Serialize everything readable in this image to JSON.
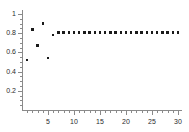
{
  "chart_data": {
    "type": "scatter",
    "title": "",
    "subtitle": "",
    "xlabel": "",
    "ylabel": "",
    "xlim": [
      0,
      30
    ],
    "ylim": [
      0,
      1
    ],
    "grid": false,
    "legend": null,
    "marker": "square",
    "marker_color": "#1a1a1a",
    "axis_color": "#8a8a8a",
    "x_ticks": [
      5,
      10,
      15,
      20,
      25,
      30
    ],
    "x_tick_labels": [
      "5",
      "10",
      "15",
      "20",
      "25",
      "30"
    ],
    "y_ticks": [
      0.2,
      0.4,
      0.6,
      0.8,
      1
    ],
    "y_tick_labels": [
      "0.2",
      "0.4",
      "0.6",
      "0.8",
      "1"
    ],
    "x": [
      1,
      2,
      3,
      4,
      5,
      6,
      7,
      8,
      9,
      10,
      11,
      12,
      13,
      14,
      15,
      16,
      17,
      18,
      19,
      20,
      21,
      22,
      23,
      24,
      25,
      26,
      27,
      28,
      29,
      30
    ],
    "values": [
      0.52,
      0.84,
      0.67,
      0.9,
      0.54,
      0.78,
      0.81,
      0.81,
      0.81,
      0.81,
      0.81,
      0.81,
      0.81,
      0.81,
      0.81,
      0.81,
      0.81,
      0.81,
      0.81,
      0.81,
      0.81,
      0.81,
      0.81,
      0.81,
      0.81,
      0.81,
      0.81,
      0.81,
      0.81,
      0.81
    ]
  }
}
